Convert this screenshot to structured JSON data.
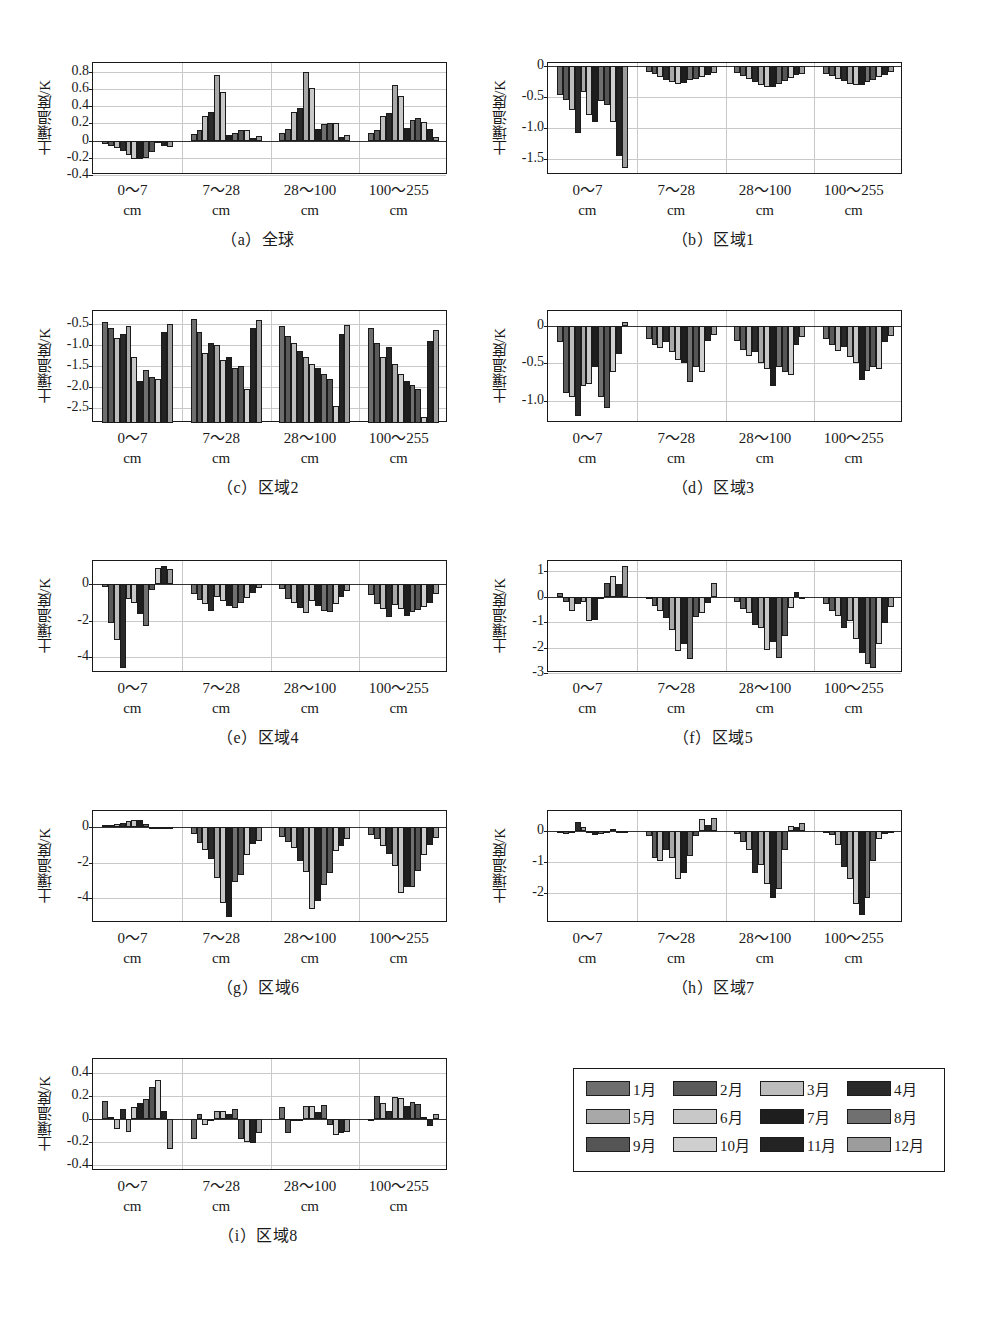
{
  "figure": {
    "ylabel": "土壤温度/K",
    "xcategories": [
      {
        "range": "0～7",
        "unit": "cm"
      },
      {
        "range": "7～28",
        "unit": "cm"
      },
      {
        "range": "28～100",
        "unit": "cm"
      },
      {
        "range": "100～255",
        "unit": "cm"
      }
    ],
    "month_colors": [
      "#6e6e6e",
      "#5a5a5a",
      "#bdbdbd",
      "#2a2a2a",
      "#a8a8a8",
      "#c8c8c8",
      "#1e1e1e",
      "#707070",
      "#555555",
      "#cfcfcf",
      "#232323",
      "#9c9c9c"
    ]
  },
  "legend": {
    "items": [
      {
        "label": "1月",
        "color": "#6e6e6e"
      },
      {
        "label": "2月",
        "color": "#5a5a5a"
      },
      {
        "label": "3月",
        "color": "#bdbdbd"
      },
      {
        "label": "4月",
        "color": "#2a2a2a"
      },
      {
        "label": "5月",
        "color": "#a8a8a8"
      },
      {
        "label": "6月",
        "color": "#c8c8c8"
      },
      {
        "label": "7月",
        "color": "#1e1e1e"
      },
      {
        "label": "8月",
        "color": "#707070"
      },
      {
        "label": "9月",
        "color": "#555555"
      },
      {
        "label": "10月",
        "color": "#cfcfcf"
      },
      {
        "label": "11月",
        "color": "#232323"
      },
      {
        "label": "12月",
        "color": "#9c9c9c"
      }
    ]
  },
  "chart_data": [
    {
      "id": "a",
      "type": "bar",
      "title": "（a）全球",
      "ylabel": "土壤温度/K",
      "xlabel": "",
      "ylim": [
        -0.4,
        0.9
      ],
      "yticks": [
        0.8,
        0.6,
        0.4,
        0.2,
        0,
        -0.2,
        -0.4
      ],
      "ytick_labels": [
        "0.8",
        "0.6",
        "0.4",
        "0.2",
        "0",
        "-0.2",
        "-0.4"
      ],
      "categories": [
        "0～7 cm",
        "7～28 cm",
        "28～100 cm",
        "100～255 cm"
      ],
      "legend_position": "external",
      "grid": true,
      "series_names": [
        "1月",
        "2月",
        "3月",
        "4月",
        "5月",
        "6月",
        "7月",
        "8月",
        "9月",
        "10月",
        "11月",
        "12月"
      ],
      "groups": [
        {
          "category": "0～7 cm",
          "values": [
            -0.04,
            -0.06,
            -0.09,
            -0.12,
            -0.17,
            -0.21,
            -0.22,
            -0.2,
            -0.13,
            -0.03,
            -0.06,
            -0.07
          ]
        },
        {
          "category": "7～28 cm",
          "values": [
            0.08,
            0.12,
            0.29,
            0.33,
            0.76,
            0.56,
            0.06,
            0.09,
            0.12,
            0.12,
            0.03,
            0.05
          ]
        },
        {
          "category": "28～100 cm",
          "values": [
            0.09,
            0.13,
            0.33,
            0.38,
            0.79,
            0.61,
            0.13,
            0.19,
            0.2,
            0.2,
            0.04,
            0.06
          ]
        },
        {
          "category": "100～255 cm",
          "values": [
            0.09,
            0.12,
            0.28,
            0.32,
            0.65,
            0.52,
            0.14,
            0.24,
            0.26,
            0.22,
            0.13,
            0.04
          ]
        }
      ]
    },
    {
      "id": "b",
      "type": "bar",
      "title": "（b）区域1",
      "ylabel": "土壤温度/K",
      "xlabel": "",
      "ylim": [
        -1.75,
        0.05
      ],
      "yticks": [
        0,
        -0.5,
        -1.0,
        -1.5
      ],
      "ytick_labels": [
        "0",
        "-0.5",
        "-1.0",
        "-1.5"
      ],
      "categories": [
        "0～7 cm",
        "7～28 cm",
        "28～100 cm",
        "100～255 cm"
      ],
      "grid": true,
      "series_names": [
        "1月",
        "2月",
        "3月",
        "4月",
        "5月",
        "6月",
        "7月",
        "8月",
        "9月",
        "10月",
        "11月",
        "12月"
      ],
      "groups": [
        {
          "category": "0～7 cm",
          "values": [
            -0.47,
            -0.55,
            -0.7,
            -1.07,
            -0.42,
            -0.79,
            -0.9,
            -0.56,
            -0.62,
            -0.9,
            -1.45,
            -1.64
          ]
        },
        {
          "category": "7～28 cm",
          "values": [
            -0.09,
            -0.13,
            -0.18,
            -0.22,
            -0.26,
            -0.29,
            -0.27,
            -0.23,
            -0.2,
            -0.17,
            -0.14,
            -0.11
          ]
        },
        {
          "category": "28～100 cm",
          "values": [
            -0.11,
            -0.16,
            -0.21,
            -0.26,
            -0.31,
            -0.34,
            -0.33,
            -0.29,
            -0.24,
            -0.19,
            -0.15,
            -0.12
          ]
        },
        {
          "category": "100～255 cm",
          "values": [
            -0.12,
            -0.16,
            -0.2,
            -0.24,
            -0.28,
            -0.31,
            -0.3,
            -0.26,
            -0.22,
            -0.18,
            -0.14,
            -0.1
          ]
        }
      ]
    },
    {
      "id": "c",
      "type": "bar",
      "title": "（c）区域2",
      "ylabel": "土壤温度/K",
      "xlabel": "",
      "ylim": [
        -2.85,
        -0.2
      ],
      "yticks": [
        -0.5,
        -1.0,
        -1.5,
        -2.0,
        -2.5
      ],
      "ytick_labels": [
        "-0.5",
        "-1.0",
        "-1.5",
        "-2.0",
        "-2.5"
      ],
      "categories": [
        "0～7 cm",
        "7～28 cm",
        "28～100 cm",
        "100～255 cm"
      ],
      "grid": true,
      "series_names": [
        "1月",
        "2月",
        "3月",
        "4月",
        "5月",
        "6月",
        "7月",
        "8月",
        "9月",
        "10月",
        "11月",
        "12月"
      ],
      "groups": [
        {
          "category": "0～7 cm",
          "values": [
            -0.45,
            -0.6,
            -0.85,
            -0.75,
            -0.55,
            -1.3,
            -1.85,
            -1.6,
            -1.75,
            -1.8,
            -0.7,
            -0.5
          ]
        },
        {
          "category": "7～28 cm",
          "values": [
            -0.4,
            -0.7,
            -1.2,
            -0.95,
            -1.0,
            -1.35,
            -1.3,
            -1.55,
            -1.5,
            -2.05,
            -0.6,
            -0.42
          ]
        },
        {
          "category": "28～100 cm",
          "values": [
            -0.55,
            -0.8,
            -0.95,
            -1.15,
            -1.3,
            -1.45,
            -1.55,
            -1.7,
            -1.8,
            -2.45,
            -0.75,
            -0.52
          ]
        },
        {
          "category": "100～255 cm",
          "values": [
            -0.6,
            -0.95,
            -1.3,
            -1.05,
            -1.45,
            -1.7,
            -1.85,
            -1.95,
            -2.05,
            -2.7,
            -0.9,
            -0.65
          ]
        }
      ]
    },
    {
      "id": "d",
      "type": "bar",
      "title": "（d）区域3",
      "ylabel": "土壤温度/K",
      "xlabel": "",
      "ylim": [
        -1.3,
        0.2
      ],
      "yticks": [
        0,
        -0.5,
        -1.0
      ],
      "ytick_labels": [
        "0",
        "-0.5",
        "-1.0"
      ],
      "categories": [
        "0～7 cm",
        "7～28 cm",
        "28～100 cm",
        "100～255 cm"
      ],
      "grid": true,
      "series_names": [
        "1月",
        "2月",
        "3月",
        "4月",
        "5月",
        "6月",
        "7月",
        "8月",
        "9月",
        "10月",
        "11月",
        "12月"
      ],
      "groups": [
        {
          "category": "0～7 cm",
          "values": [
            -0.22,
            -0.9,
            -0.95,
            -1.2,
            -0.8,
            -0.78,
            -0.55,
            -0.95,
            -1.1,
            -0.62,
            -0.38,
            0.05
          ]
        },
        {
          "category": "7～28 cm",
          "values": [
            -0.18,
            -0.25,
            -0.3,
            -0.22,
            -0.35,
            -0.45,
            -0.5,
            -0.75,
            -0.55,
            -0.62,
            -0.2,
            -0.12
          ]
        },
        {
          "category": "28～100 cm",
          "values": [
            -0.2,
            -0.32,
            -0.4,
            -0.35,
            -0.5,
            -0.58,
            -0.8,
            -0.55,
            -0.62,
            -0.66,
            -0.25,
            -0.15
          ]
        },
        {
          "category": "100～255 cm",
          "values": [
            -0.18,
            -0.26,
            -0.33,
            -0.28,
            -0.42,
            -0.5,
            -0.72,
            -0.6,
            -0.55,
            -0.58,
            -0.22,
            -0.14
          ]
        }
      ]
    },
    {
      "id": "e",
      "type": "bar",
      "title": "（e）区域4",
      "ylabel": "土壤温度/K",
      "xlabel": "",
      "ylim": [
        -4.9,
        1.3
      ],
      "yticks": [
        0,
        -2,
        -4
      ],
      "ytick_labels": [
        "0",
        "-2",
        "-4"
      ],
      "categories": [
        "0～7 cm",
        "7～28 cm",
        "28～100 cm",
        "100～255 cm"
      ],
      "grid": true,
      "series_names": [
        "1月",
        "2月",
        "3月",
        "4月",
        "5月",
        "6月",
        "7月",
        "8月",
        "9月",
        "10月",
        "11月",
        "12月"
      ],
      "groups": [
        {
          "category": "0～7 cm",
          "values": [
            -0.15,
            -2.15,
            -3.05,
            -4.6,
            -0.8,
            -1.0,
            -1.65,
            -2.3,
            -0.3,
            0.9,
            1.05,
            0.85
          ]
        },
        {
          "category": "7～28 cm",
          "values": [
            -0.55,
            -0.85,
            -1.1,
            -1.45,
            -0.7,
            -0.9,
            -1.2,
            -1.3,
            -1.05,
            -0.75,
            -0.45,
            -0.2
          ]
        },
        {
          "category": "28～100 cm",
          "values": [
            -0.25,
            -0.8,
            -1.05,
            -1.3,
            -1.6,
            -0.9,
            -1.2,
            -1.45,
            -1.55,
            -1.1,
            -0.7,
            -0.35
          ]
        },
        {
          "category": "100～255 cm",
          "values": [
            -0.6,
            -1.1,
            -1.35,
            -1.8,
            -1.15,
            -1.35,
            -1.75,
            -1.55,
            -1.4,
            -1.25,
            -1.0,
            -0.55
          ]
        }
      ]
    },
    {
      "id": "f",
      "type": "bar",
      "title": "（f）区域5",
      "ylabel": "土壤温度/K",
      "xlabel": "",
      "ylim": [
        -3.0,
        1.4
      ],
      "yticks": [
        1,
        0,
        -1,
        -2,
        -3
      ],
      "ytick_labels": [
        "1",
        "0",
        "-1",
        "-2",
        "-3"
      ],
      "categories": [
        "0～7 cm",
        "7～28 cm",
        "28～100 cm",
        "100～255 cm"
      ],
      "grid": true,
      "series_names": [
        "1月",
        "2月",
        "3月",
        "4月",
        "5月",
        "6月",
        "7月",
        "8月",
        "9月",
        "10月",
        "11月",
        "12月"
      ],
      "groups": [
        {
          "category": "0～7 cm",
          "values": [
            0.15,
            -0.22,
            -0.55,
            -0.3,
            -0.22,
            -0.95,
            -0.9,
            -0.1,
            0.55,
            0.8,
            0.5,
            1.2
          ]
        },
        {
          "category": "7～28 cm",
          "values": [
            -0.08,
            -0.35,
            -0.55,
            -0.85,
            -1.3,
            -2.15,
            -1.85,
            -2.45,
            -0.8,
            -0.65,
            -0.25,
            0.55
          ]
        },
        {
          "category": "28～100 cm",
          "values": [
            -0.2,
            -0.48,
            -0.65,
            -1.1,
            -1.25,
            -2.1,
            -1.8,
            -2.4,
            -1.55,
            -0.45,
            0.2,
            -0.05
          ]
        },
        {
          "category": "100～255 cm",
          "values": [
            -0.3,
            -0.55,
            -0.75,
            -1.25,
            -0.95,
            -1.65,
            -2.2,
            -2.65,
            -2.8,
            -1.85,
            -1.05,
            -0.4
          ]
        }
      ]
    },
    {
      "id": "g",
      "type": "bar",
      "title": "（g）区域6",
      "ylabel": "土壤温度/K",
      "xlabel": "",
      "ylim": [
        -5.4,
        0.9
      ],
      "yticks": [
        0,
        -2,
        -4
      ],
      "ytick_labels": [
        "0",
        "-2",
        "-4"
      ],
      "categories": [
        "0～7 cm",
        "7～28 cm",
        "28～100 cm",
        "100～255 cm"
      ],
      "grid": true,
      "series_names": [
        "1月",
        "2月",
        "3月",
        "4月",
        "5月",
        "6月",
        "7月",
        "8月",
        "9月",
        "10月",
        "11月",
        "12月"
      ],
      "groups": [
        {
          "category": "0～7 cm",
          "values": [
            0.1,
            0.12,
            0.18,
            0.22,
            0.35,
            0.42,
            0.38,
            0.15,
            -0.05,
            -0.05,
            -0.05,
            -0.05
          ]
        },
        {
          "category": "7～28 cm",
          "values": [
            -0.4,
            -0.9,
            -1.3,
            -1.8,
            -2.85,
            -4.25,
            -5.05,
            -3.1,
            -2.7,
            -1.6,
            -0.95,
            -0.8
          ]
        },
        {
          "category": "28～100 cm",
          "values": [
            -0.55,
            -0.85,
            -1.2,
            -1.9,
            -2.55,
            -4.6,
            -4.15,
            -3.25,
            -2.6,
            -1.35,
            -1.05,
            -0.7
          ]
        },
        {
          "category": "100～255 cm",
          "values": [
            -0.45,
            -0.7,
            -1.05,
            -1.5,
            -2.2,
            -3.7,
            -3.35,
            -3.4,
            -2.45,
            -1.6,
            -1.0,
            -0.6
          ]
        }
      ]
    },
    {
      "id": "h",
      "type": "bar",
      "title": "（h）区域7",
      "ylabel": "土壤温度/K",
      "xlabel": "",
      "ylim": [
        -2.95,
        0.65
      ],
      "yticks": [
        0,
        -1,
        -2
      ],
      "ytick_labels": [
        "0",
        "-1",
        "-2"
      ],
      "categories": [
        "0～7 cm",
        "7～28 cm",
        "28～100 cm",
        "100～255 cm"
      ],
      "grid": true,
      "series_names": [
        "1月",
        "2月",
        "3月",
        "4月",
        "5月",
        "6月",
        "7月",
        "8月",
        "9月",
        "10月",
        "11月",
        "12月"
      ],
      "groups": [
        {
          "category": "0～7 cm",
          "values": [
            -0.06,
            -0.08,
            -0.05,
            0.3,
            0.15,
            -0.05,
            -0.12,
            -0.1,
            -0.04,
            0.08,
            -0.02,
            -0.02
          ]
        },
        {
          "category": "7～28 cm",
          "values": [
            -0.15,
            -0.85,
            -0.95,
            -0.6,
            -0.85,
            -1.55,
            -1.35,
            -0.8,
            -0.15,
            0.4,
            0.2,
            0.42
          ]
        },
        {
          "category": "28～100 cm",
          "values": [
            -0.1,
            -0.35,
            -0.6,
            -1.35,
            -1.1,
            -1.7,
            -2.15,
            -1.85,
            -0.6,
            0.18,
            0.12,
            0.25
          ]
        },
        {
          "category": "100～255 cm",
          "values": [
            -0.05,
            -0.12,
            -0.45,
            -1.15,
            -1.55,
            -2.35,
            -2.7,
            -2.15,
            -0.95,
            -0.25,
            -0.08,
            -0.05
          ]
        }
      ]
    },
    {
      "id": "i",
      "type": "bar",
      "title": "（i）区域8",
      "ylabel": "土壤温度/K",
      "xlabel": "",
      "ylim": [
        -0.45,
        0.52
      ],
      "yticks": [
        0.4,
        0.2,
        0,
        -0.2,
        -0.4
      ],
      "ytick_labels": [
        "0.4",
        "0.2",
        "0",
        "-0.2",
        "-0.4"
      ],
      "categories": [
        "0～7 cm",
        "7～28 cm",
        "28～100 cm",
        "100～255 cm"
      ],
      "grid": true,
      "series_names": [
        "1月",
        "2月",
        "3月",
        "4月",
        "5月",
        "6月",
        "7月",
        "8月",
        "9月",
        "10月",
        "11月",
        "12月"
      ],
      "groups": [
        {
          "category": "0～7 cm",
          "values": [
            0.16,
            0.02,
            -0.09,
            0.09,
            -0.11,
            0.1,
            0.14,
            0.17,
            0.28,
            0.34,
            0.07,
            -0.26
          ]
        },
        {
          "category": "7～28 cm",
          "values": [
            -0.17,
            0.04,
            -0.05,
            -0.01,
            0.07,
            0.07,
            0.04,
            0.09,
            -0.17,
            -0.2,
            -0.21,
            -0.12
          ]
        },
        {
          "category": "28～100 cm",
          "values": [
            0.1,
            -0.12,
            -0.02,
            -0.01,
            0.11,
            0.11,
            0.06,
            0.12,
            -0.05,
            -0.14,
            -0.12,
            -0.11
          ]
        },
        {
          "category": "100～255 cm",
          "values": [
            -0.02,
            0.2,
            0.14,
            0.07,
            0.19,
            0.18,
            0.11,
            0.15,
            0.13,
            0.02,
            -0.06,
            0.04
          ]
        }
      ]
    }
  ]
}
